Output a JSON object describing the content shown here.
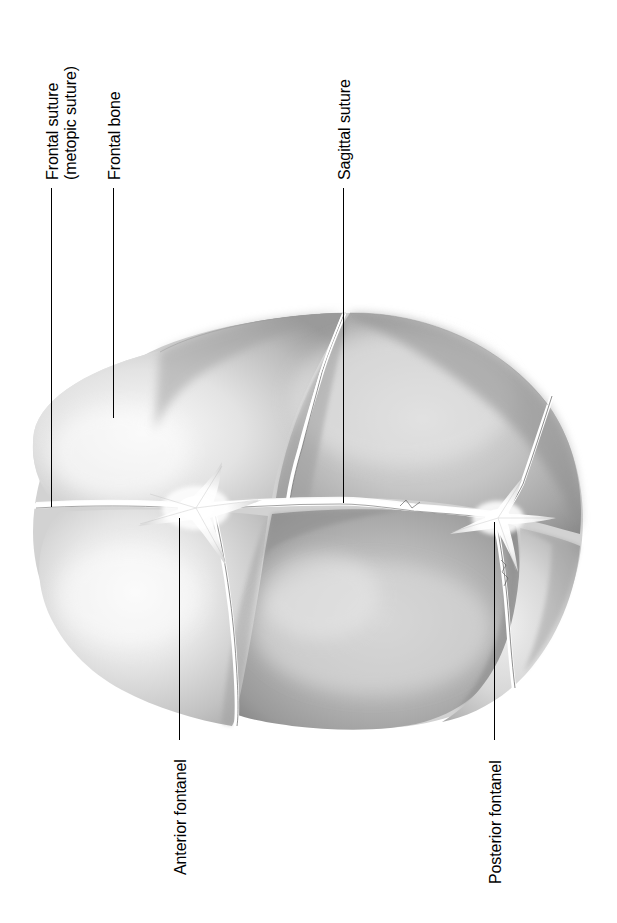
{
  "figure": {
    "view": "superior (top) view",
    "orientation": "rotated 90 degrees counter-clockwise",
    "background_color": "#ffffff",
    "line_color": "#000000",
    "bone_light": "#f2f2f2",
    "bone_mid": "#c9c9c9",
    "bone_dark": "#8e8e8e",
    "suture_color": "#ffffff"
  },
  "labels": [
    {
      "id": "frontal-suture",
      "line1": "Frontal suture",
      "line2": "(metopic suture)",
      "leader": {
        "x": 51,
        "y_top": 188,
        "y_bottom": 507
      }
    },
    {
      "id": "frontal-bone",
      "line1": "Frontal bone",
      "line2": "",
      "leader": {
        "x": 113,
        "y_top": 188,
        "y_bottom": 418
      }
    },
    {
      "id": "sagittal-suture",
      "line1": "Sagittal suture",
      "line2": "",
      "leader": {
        "x": 343,
        "y_top": 188,
        "y_bottom": 503
      }
    },
    {
      "id": "anterior-fontanel",
      "line1": "Anterior fontanel",
      "line2": "",
      "leader": {
        "x": 179,
        "y_top": 518,
        "y_bottom": 740
      }
    },
    {
      "id": "posterior-fontanel",
      "line1": "Posterior fontanel",
      "line2": "",
      "leader": {
        "x": 494,
        "y_top": 522,
        "y_bottom": 740
      }
    }
  ],
  "anatomy": {
    "bones": [
      "left frontal bone",
      "right frontal bone",
      "left parietal bone",
      "right parietal bone",
      "occipital bone"
    ],
    "sutures": [
      "frontal (metopic) suture",
      "sagittal suture",
      "coronal suture",
      "lambdoid suture"
    ],
    "fontanels": [
      "anterior fontanel",
      "posterior fontanel"
    ]
  }
}
